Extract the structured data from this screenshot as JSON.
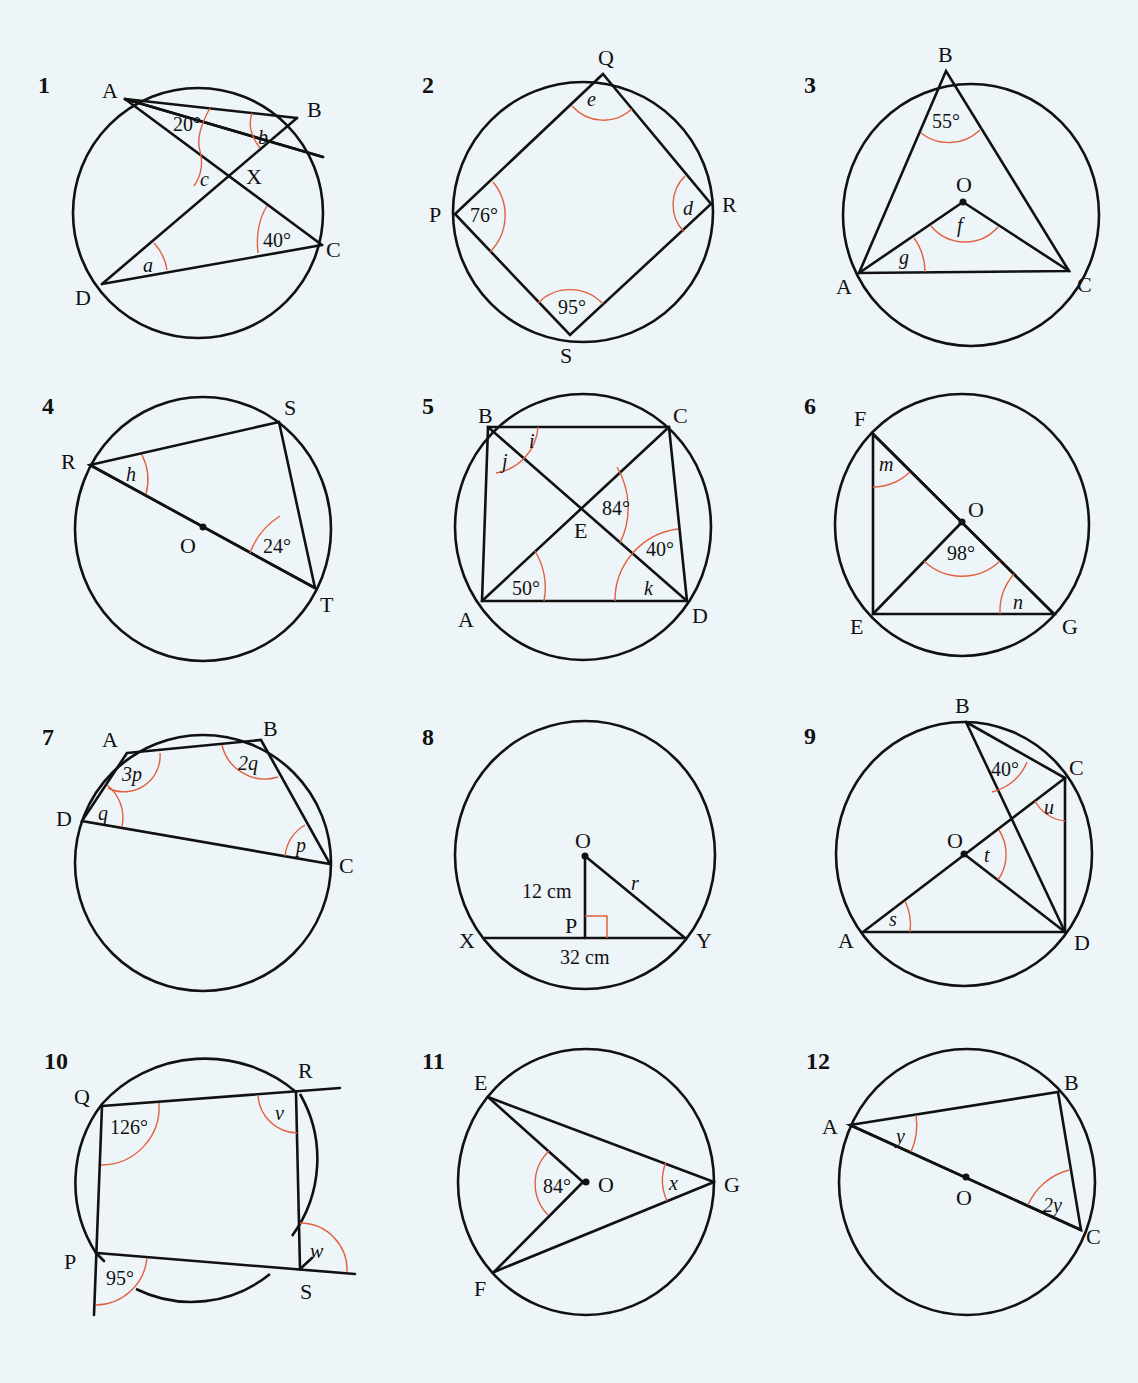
{
  "page": {
    "background": "#eef5f9",
    "line_color": "#111111",
    "angle_arc_color": "#e2603f"
  },
  "problems": [
    {
      "number": "1",
      "points": {
        "A": "A",
        "B": "B",
        "C": "C",
        "D": "D",
        "X": "X"
      },
      "angles": {
        "BAC": "20°",
        "ACD": "40°",
        "a": "a",
        "b": "b",
        "c": "c"
      }
    },
    {
      "number": "2",
      "points": {
        "P": "P",
        "Q": "Q",
        "R": "R",
        "S": "S"
      },
      "angles": {
        "P": "76°",
        "S": "95°",
        "e": "e",
        "d": "d"
      }
    },
    {
      "number": "3",
      "points": {
        "A": "A",
        "B": "B",
        "C": "C",
        "O": "O"
      },
      "angles": {
        "B": "55°",
        "f": "f",
        "g": "g"
      }
    },
    {
      "number": "4",
      "points": {
        "R": "R",
        "S": "S",
        "T": "T",
        "O": "O"
      },
      "angles": {
        "T": "24°",
        "h": "h"
      }
    },
    {
      "number": "5",
      "points": {
        "A": "A",
        "B": "B",
        "C": "C",
        "D": "D",
        "E": "E"
      },
      "angles": {
        "CAD": "50°",
        "CED": "84°",
        "BDC": "40°",
        "i": "i",
        "j": "j",
        "k": "k"
      }
    },
    {
      "number": "6",
      "points": {
        "E": "E",
        "F": "F",
        "G": "G",
        "O": "O"
      },
      "angles": {
        "EOG": "98°",
        "m": "m",
        "n": "n"
      }
    },
    {
      "number": "7",
      "points": {
        "A": "A",
        "B": "B",
        "C": "C",
        "D": "D"
      },
      "angles": {
        "A": "3p",
        "B": "2q",
        "C": "p",
        "D": "q"
      }
    },
    {
      "number": "8",
      "points": {
        "O": "O",
        "P": "P",
        "X": "X",
        "Y": "Y"
      },
      "lengths": {
        "OP": "12 cm",
        "XY": "32 cm",
        "r": "r"
      }
    },
    {
      "number": "9",
      "points": {
        "A": "A",
        "B": "B",
        "C": "C",
        "D": "D",
        "O": "O"
      },
      "angles": {
        "DBC": "40°",
        "s": "s",
        "t": "t",
        "u": "u"
      }
    },
    {
      "number": "10",
      "points": {
        "P": "P",
        "Q": "Q",
        "R": "R",
        "S": "S"
      },
      "angles": {
        "Q": "126°",
        "P_ext": "95°",
        "v": "v",
        "w": "w"
      }
    },
    {
      "number": "11",
      "points": {
        "E": "E",
        "F": "F",
        "G": "G",
        "O": "O"
      },
      "angles": {
        "EOF": "84°",
        "x": "x"
      }
    },
    {
      "number": "12",
      "points": {
        "A": "A",
        "B": "B",
        "C": "C",
        "O": "O"
      },
      "angles": {
        "y": "y",
        "2y": "2y"
      }
    }
  ]
}
